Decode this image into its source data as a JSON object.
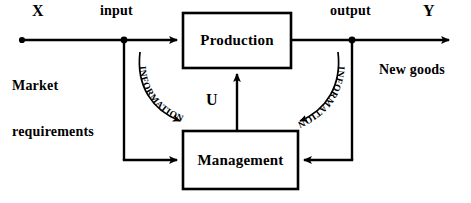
{
  "diagram": {
    "background_color": "#ffffff",
    "line_color": "#000000",
    "nodes": [
      {
        "id": "production",
        "label": "Production",
        "x": 183,
        "y": 13,
        "width": 108,
        "height": 55
      },
      {
        "id": "management",
        "label": "Management",
        "x": 183,
        "y": 131,
        "width": 115,
        "height": 58
      }
    ],
    "labels": {
      "x_symbol": "X",
      "y_symbol": "Y",
      "input": "input",
      "output": "output",
      "market_requirements_line1": "Market",
      "market_requirements_line2": "requirements",
      "new_goods": "New goods",
      "control_symbol": "U",
      "information_left": "INFORMATION",
      "information_right": "INFORMATION"
    },
    "flows": [
      {
        "from": "X",
        "to": "input",
        "type": "line"
      },
      {
        "from": "input",
        "to": "production",
        "type": "arrow"
      },
      {
        "from": "production",
        "to": "output",
        "type": "line"
      },
      {
        "from": "output",
        "to": "Y",
        "type": "arrow"
      },
      {
        "from": "input",
        "to": "management",
        "type": "arrow",
        "annotation": "INFORMATION"
      },
      {
        "from": "output",
        "to": "management",
        "type": "arrow",
        "annotation": "INFORMATION"
      },
      {
        "from": "management",
        "to": "production",
        "type": "arrow",
        "annotation": "U"
      }
    ],
    "junction_dots": [
      {
        "id": "origin-dot",
        "x": 22,
        "y": 40
      },
      {
        "id": "input-dot",
        "x": 124,
        "y": 40
      },
      {
        "id": "output-dot",
        "x": 352,
        "y": 40
      }
    ]
  }
}
